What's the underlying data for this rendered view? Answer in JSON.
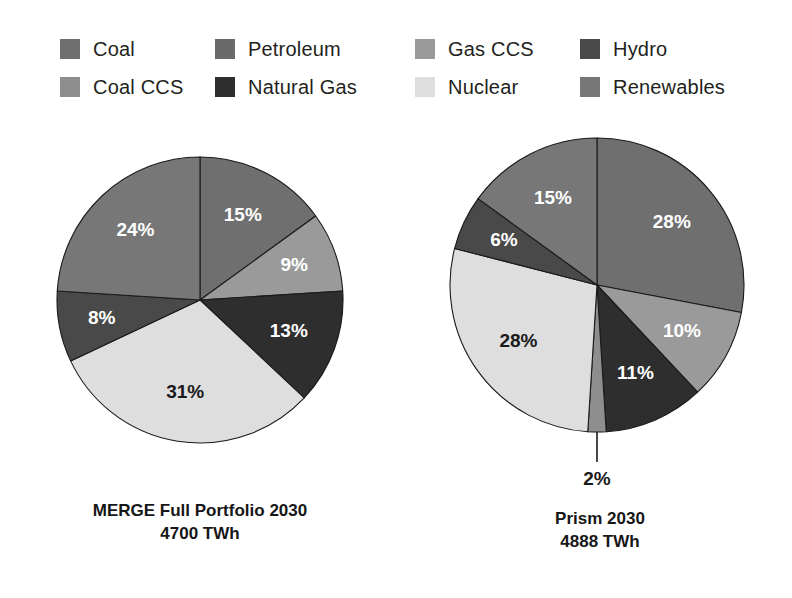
{
  "legend": {
    "items": [
      {
        "label": "Coal",
        "color": "#6f6f6f",
        "icon": "legend-swatch"
      },
      {
        "label": "Petroleum",
        "color": "#6a6a6a",
        "icon": "legend-swatch"
      },
      {
        "label": "Gas CCS",
        "color": "#9a9a9a",
        "icon": "legend-swatch"
      },
      {
        "label": "Hydro",
        "color": "#494949",
        "icon": "legend-swatch"
      },
      {
        "label": "Coal CCS",
        "color": "#8e8e8e",
        "icon": "legend-swatch"
      },
      {
        "label": "Natural Gas",
        "color": "#2e2e2e",
        "icon": "legend-swatch"
      },
      {
        "label": "Nuclear",
        "color": "#dedede",
        "icon": "legend-swatch"
      },
      {
        "label": "Renewables",
        "color": "#777777",
        "icon": "legend-swatch"
      }
    ]
  },
  "chart_data": [
    {
      "type": "pie",
      "title": "MERGE Full Portfolio 2030",
      "subtitle": "4700 TWh",
      "total_label": "4700 TWh",
      "start_angle_deg": 0,
      "direction": "clockwise",
      "categories": [
        "Coal",
        "Gas CCS",
        "Natural Gas",
        "Nuclear",
        "Hydro",
        "Renewables"
      ],
      "values": [
        15,
        9,
        13,
        31,
        8,
        24
      ],
      "labels": [
        "15%",
        "9%",
        "13%",
        "31%",
        "8%",
        "24%"
      ],
      "colors": [
        "#6f6f6f",
        "#9a9a9a",
        "#2e2e2e",
        "#dedede",
        "#494949",
        "#777777"
      ],
      "label_colors": [
        "light",
        "light",
        "light",
        "dark",
        "light",
        "light"
      ],
      "units": "percent",
      "legend_position": "top"
    },
    {
      "type": "pie",
      "title": "Prism 2030",
      "subtitle": "4888 TWh",
      "total_label": "4888 TWh",
      "start_angle_deg": 0,
      "direction": "clockwise",
      "categories": [
        "Coal",
        "Gas CCS",
        "Natural Gas",
        "Coal CCS",
        "Nuclear",
        "Hydro",
        "Renewables"
      ],
      "values": [
        28,
        10,
        11,
        2,
        28,
        6,
        15
      ],
      "labels": [
        "28%",
        "10%",
        "11%",
        "2%",
        "28%",
        "6%",
        "15%"
      ],
      "colors": [
        "#6f6f6f",
        "#9a9a9a",
        "#2e2e2e",
        "#8e8e8e",
        "#dedede",
        "#494949",
        "#777777"
      ],
      "label_colors": [
        "light",
        "light",
        "light",
        "dark",
        "dark",
        "light",
        "light"
      ],
      "callout_index": 3,
      "units": "percent",
      "legend_position": "top"
    }
  ],
  "charts": {
    "left": {
      "caption_line1": "MERGE Full Portfolio 2030",
      "caption_line2": "4700 TWh"
    },
    "right": {
      "caption_line1": "Prism 2030",
      "caption_line2": "4888 TWh"
    }
  },
  "geometry": {
    "left_pie": {
      "cx": 200,
      "cy": 300,
      "r": 143
    },
    "right_pie": {
      "cx": 597,
      "cy": 285,
      "r": 147
    }
  }
}
